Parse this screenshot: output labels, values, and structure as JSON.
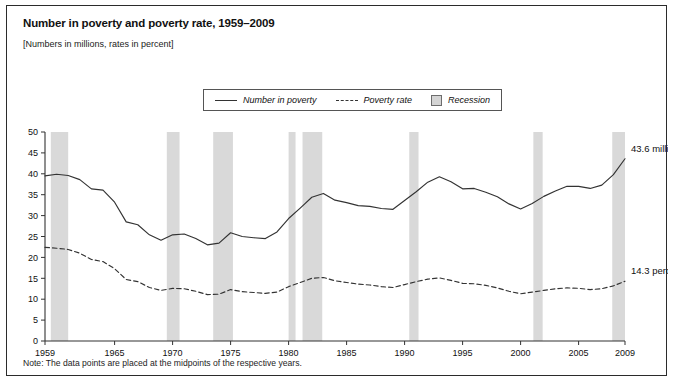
{
  "figure": {
    "title": "Number in poverty and poverty rate, 1959–2009",
    "subtitle": "[Numbers in millions, rates in percent]",
    "note": "Note: The data points are placed at the midpoints of the respective years."
  },
  "legend": {
    "position": "top-center",
    "items": [
      {
        "label": "Number in poverty",
        "style": "solid-line",
        "icon": "solid-line-swatch"
      },
      {
        "label": "Poverty rate",
        "style": "dashed-line",
        "icon": "dashed-line-swatch"
      },
      {
        "label": "Recession",
        "style": "shaded-band",
        "icon": "gray-box-swatch"
      }
    ]
  },
  "colors": {
    "line": "#333333",
    "recession_band": "#d9d9d9",
    "axis": "#333333",
    "frame": "#2b2b2b",
    "background": "#ffffff"
  },
  "annotations": [
    {
      "text": "43.6 million",
      "year": 2009,
      "value": 43.6,
      "series": "Number in poverty"
    },
    {
      "text": "14.3 percent",
      "year": 2009,
      "value": 14.3,
      "series": "Poverty rate"
    }
  ],
  "chart_data": {
    "type": "line",
    "title": "Number in poverty and poverty rate, 1959–2009",
    "subtitle": "[Numbers in millions, rates in percent]",
    "xlabel": "",
    "ylabel": "",
    "xlim": [
      1959,
      2009
    ],
    "ylim": [
      0,
      50
    ],
    "yticks": [
      0,
      5,
      10,
      15,
      20,
      25,
      30,
      35,
      40,
      45,
      50
    ],
    "xticks": [
      1959,
      1965,
      1970,
      1975,
      1980,
      1985,
      1990,
      1995,
      2000,
      2005,
      2009
    ],
    "xticklabels": [
      "1959",
      "1965",
      "1970",
      "1975",
      "1980",
      "1985",
      "1990",
      "1995",
      "2000",
      "2005",
      "2009"
    ],
    "grid": false,
    "x": [
      1959,
      1960,
      1961,
      1962,
      1963,
      1964,
      1965,
      1966,
      1967,
      1968,
      1969,
      1970,
      1971,
      1972,
      1973,
      1974,
      1975,
      1976,
      1977,
      1978,
      1979,
      1980,
      1981,
      1982,
      1983,
      1984,
      1985,
      1986,
      1987,
      1988,
      1989,
      1990,
      1991,
      1992,
      1993,
      1994,
      1995,
      1996,
      1997,
      1998,
      1999,
      2000,
      2001,
      2002,
      2003,
      2004,
      2005,
      2006,
      2007,
      2008,
      2009
    ],
    "series": [
      {
        "name": "Number in poverty",
        "unit": "millions",
        "style": "solid",
        "values": [
          39.5,
          39.9,
          39.6,
          38.6,
          36.4,
          36.1,
          33.2,
          28.5,
          27.8,
          25.4,
          24.1,
          25.4,
          25.6,
          24.5,
          23.0,
          23.4,
          25.9,
          25.0,
          24.7,
          24.5,
          26.1,
          29.3,
          31.8,
          34.4,
          35.3,
          33.7,
          33.1,
          32.4,
          32.2,
          31.7,
          31.5,
          33.6,
          35.7,
          38.0,
          39.3,
          38.1,
          36.4,
          36.5,
          35.6,
          34.5,
          32.8,
          31.6,
          32.9,
          34.6,
          35.9,
          37.0,
          37.0,
          36.5,
          37.3,
          39.8,
          43.6
        ]
      },
      {
        "name": "Poverty rate",
        "unit": "percent",
        "style": "dashed",
        "values": [
          22.4,
          22.2,
          21.9,
          21.0,
          19.5,
          19.0,
          17.3,
          14.7,
          14.2,
          12.8,
          12.1,
          12.6,
          12.5,
          11.9,
          11.1,
          11.2,
          12.3,
          11.8,
          11.6,
          11.4,
          11.7,
          13.0,
          14.0,
          15.0,
          15.2,
          14.4,
          14.0,
          13.6,
          13.4,
          13.0,
          12.8,
          13.5,
          14.2,
          14.8,
          15.1,
          14.5,
          13.8,
          13.7,
          13.3,
          12.7,
          11.9,
          11.3,
          11.7,
          12.1,
          12.5,
          12.7,
          12.6,
          12.3,
          12.5,
          13.2,
          14.3
        ]
      }
    ],
    "recessions": [
      {
        "start": 1959.5,
        "end": 1961.0,
        "label": "1960-61 recession"
      },
      {
        "start": 1969.5,
        "end": 1970.6,
        "label": "1969-70 recession"
      },
      {
        "start": 1973.5,
        "end": 1975.2,
        "label": "1973-75 recession"
      },
      {
        "start": 1980.0,
        "end": 1980.6,
        "label": "1980 recession"
      },
      {
        "start": 1981.2,
        "end": 1982.9,
        "label": "1981-82 recession"
      },
      {
        "start": 1990.4,
        "end": 1991.2,
        "label": "1990-91 recession"
      },
      {
        "start": 2001.1,
        "end": 2001.9,
        "label": "2001 recession"
      },
      {
        "start": 2007.9,
        "end": 2009.5,
        "label": "2007-09 recession"
      }
    ]
  }
}
